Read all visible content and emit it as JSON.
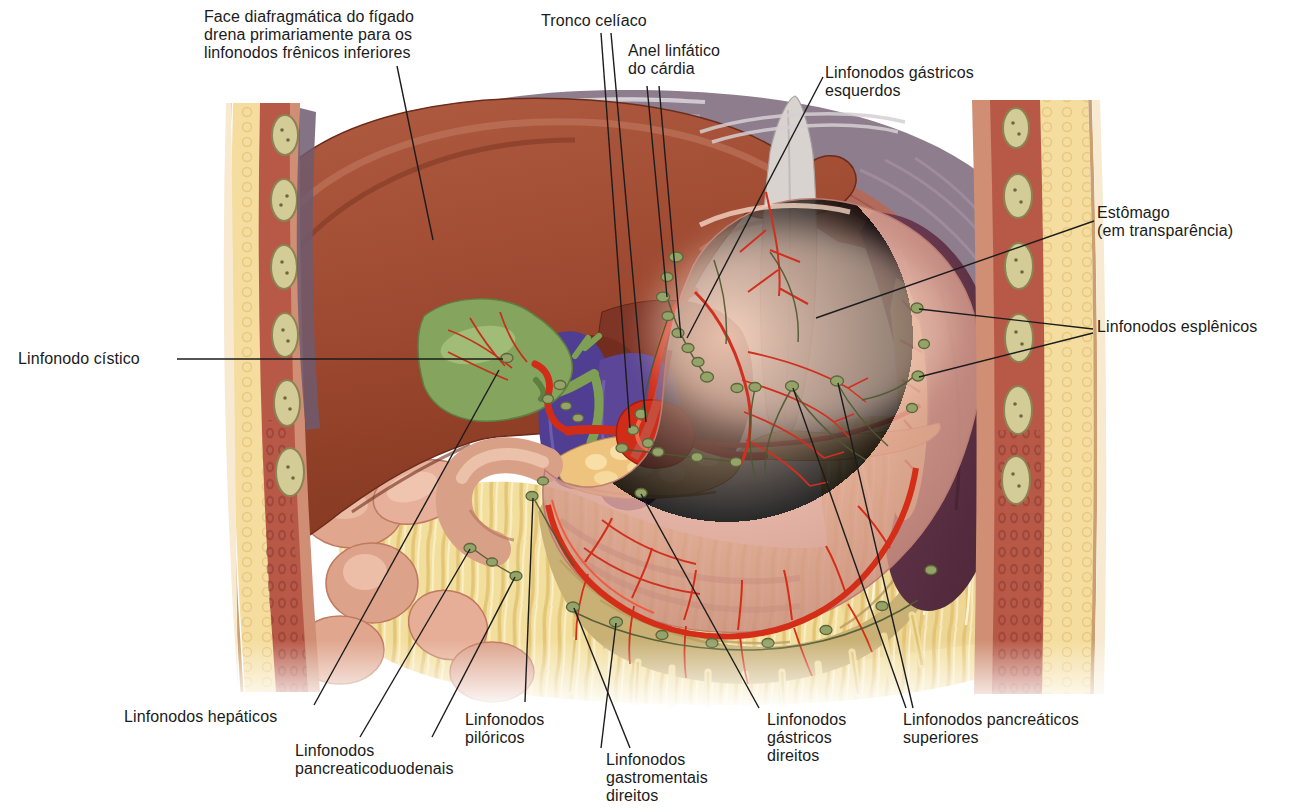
{
  "figure": {
    "type": "anatomical-diagram",
    "language": "pt-BR",
    "labels": [
      {
        "id": "face-diafragmatica",
        "text": "Face diafragmática do fígado\ndrena primariamente para os\nlinfonodos frênicos inferiores"
      },
      {
        "id": "tronco-celiaco",
        "text": "Tronco celíaco"
      },
      {
        "id": "anel-linfatico-cardia",
        "text": "Anel linfático\ndo cárdia"
      },
      {
        "id": "linfonodos-gastricos-esquerdos",
        "text": "Linfonodos gástricos\nesquerdos"
      },
      {
        "id": "estomago-em-transparencia",
        "text": "Estômago\n(em transparência)"
      },
      {
        "id": "linfonodos-esplenicos",
        "text": "Linfonodos esplênicos"
      },
      {
        "id": "linfonodo-cistico",
        "text": "Linfonodo cístico"
      },
      {
        "id": "linfonodos-hepaticos",
        "text": "Linfonodos hepáticos"
      },
      {
        "id": "linfonodos-pancreaticoduodenais",
        "text": "Linfonodos\npancreaticoduodenais"
      },
      {
        "id": "linfonodos-piloricos",
        "text": "Linfonodos\npilóricos"
      },
      {
        "id": "linfonodos-gastromentais-direitos",
        "text": "Linfonodos\ngastromentais\ndireitos"
      },
      {
        "id": "linfonodos-gastricos-direitos",
        "text": "Linfonodos\ngástricos\ndireitos"
      },
      {
        "id": "linfonodos-pancreaticos-superiores",
        "text": "Linfonodos pancreáticos\nsuperiores"
      }
    ],
    "palette": {
      "label_text": "#1b1b1b",
      "leader_line": "#1c1c1c",
      "liver": "#9c472f",
      "stomach": "#d89d8d",
      "spleen": "#5d3045",
      "gallbladder": "#85a55e",
      "portal_vein": "#4f3e92",
      "artery": "#d12c18",
      "pancreas": "#eec37e",
      "omentum_fat": "#f3df9d",
      "lymph_node": "#95a268",
      "lymph_vessel": "#4c5930",
      "diaphragm": "#8e7d8c",
      "body_wall_fat": "#f4dd9e",
      "body_wall_muscle": "#b85948",
      "costal_cartilage": "#d3cc96"
    }
  }
}
